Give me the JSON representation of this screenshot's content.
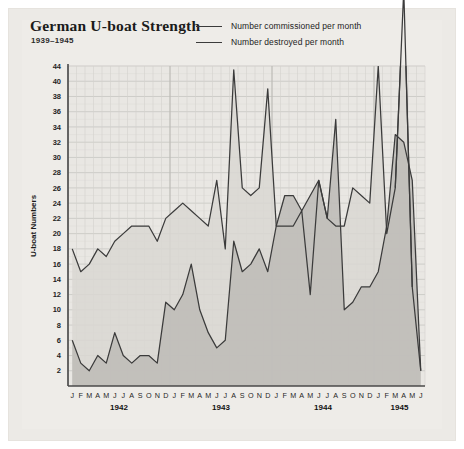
{
  "figure": {
    "background_color": "#eceae6",
    "plot_background_color": "#e9e7e3"
  },
  "header": {
    "title": "German U-boat Strength",
    "subtitle": "1939–1945"
  },
  "legend": {
    "position": "top-right",
    "items": [
      {
        "label": "Number commissioned per month",
        "color": "#3b3b3b",
        "key": "commissioned"
      },
      {
        "label": "Number destroyed per month",
        "color": "#3b3b3b",
        "key": "destroyed"
      }
    ]
  },
  "annotations": [
    {
      "text": "64",
      "series": "commissioned",
      "note": "peak value exceeding axis top"
    }
  ],
  "chart_data": {
    "type": "line",
    "title": "German U-boat Strength",
    "subtitle": "1939–1945",
    "xlabel": "",
    "ylabel": "U-boat Numbers",
    "ylim": [
      0,
      44
    ],
    "yticks": [
      2,
      4,
      6,
      8,
      10,
      12,
      14,
      16,
      18,
      20,
      22,
      24,
      26,
      28,
      30,
      32,
      34,
      36,
      38,
      40,
      44
    ],
    "grid": true,
    "legend_position": "top-right",
    "x": [
      "1942-01",
      "1942-02",
      "1942-03",
      "1942-04",
      "1942-05",
      "1942-06",
      "1942-07",
      "1942-08",
      "1942-09",
      "1942-10",
      "1942-11",
      "1942-12",
      "1943-01",
      "1943-02",
      "1943-03",
      "1943-04",
      "1943-05",
      "1943-06",
      "1943-07",
      "1943-08",
      "1943-09",
      "1943-10",
      "1943-11",
      "1943-12",
      "1944-01",
      "1944-02",
      "1944-03",
      "1944-04",
      "1944-05",
      "1944-06",
      "1944-07",
      "1944-08",
      "1944-09",
      "1944-10",
      "1944-11",
      "1944-12",
      "1945-01",
      "1945-02",
      "1945-03",
      "1945-04",
      "1945-05",
      "1945-06"
    ],
    "month_labels": [
      "J",
      "F",
      "M",
      "A",
      "M",
      "J",
      "J",
      "A",
      "S",
      "O",
      "N",
      "D",
      "J",
      "F",
      "M",
      "A",
      "M",
      "J",
      "J",
      "A",
      "S",
      "O",
      "N",
      "D",
      "J",
      "F",
      "M",
      "A",
      "M",
      "J",
      "J",
      "A",
      "S",
      "O",
      "N",
      "D",
      "J",
      "F",
      "M",
      "A",
      "M",
      "J"
    ],
    "year_groups": [
      {
        "label": "1942",
        "start_index": 0,
        "end_index": 11
      },
      {
        "label": "1943",
        "start_index": 12,
        "end_index": 23
      },
      {
        "label": "1944",
        "start_index": 24,
        "end_index": 35
      },
      {
        "label": "1945",
        "start_index": 36,
        "end_index": 41
      }
    ],
    "series": [
      {
        "name": "Number commissioned per month",
        "key": "commissioned",
        "color": "#3b3b3b",
        "values": [
          18,
          15,
          16,
          18,
          17,
          19,
          20,
          21,
          21,
          21,
          19,
          22,
          23,
          24,
          23,
          22,
          21,
          27,
          18,
          43,
          26,
          25,
          26,
          39,
          21,
          21,
          21,
          23,
          12,
          27,
          22,
          21,
          21,
          26,
          25,
          24,
          44,
          20,
          26,
          64,
          13,
          2
        ]
      },
      {
        "name": "Number destroyed per month",
        "key": "destroyed",
        "color": "#3b3b3b",
        "values": [
          6,
          3,
          2,
          4,
          3,
          7,
          4,
          3,
          4,
          4,
          3,
          11,
          10,
          12,
          16,
          10,
          7,
          5,
          6,
          19,
          15,
          16,
          18,
          15,
          21,
          25,
          25,
          23,
          25,
          27,
          22,
          35,
          10,
          11,
          13,
          13,
          15,
          21,
          33,
          32,
          27,
          2
        ]
      }
    ]
  },
  "axes": {
    "y_title": "U-boat Numbers"
  }
}
